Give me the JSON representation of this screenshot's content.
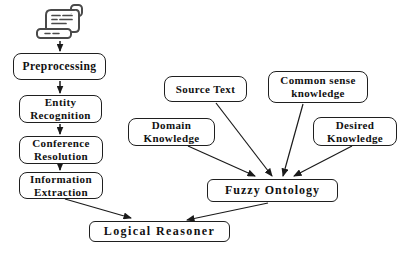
{
  "diagram": {
    "nodes": {
      "preprocessing": {
        "label": "Preprocessing"
      },
      "entity_recognition": {
        "label": "Entity Recognition"
      },
      "conference_resolution": {
        "label": "Conference Resolution"
      },
      "information_extraction": {
        "label": "Information Extraction"
      },
      "logical_reasoner": {
        "label": "Logical Reasoner"
      },
      "source_text": {
        "label": "Source Text"
      },
      "common_sense_knowledge": {
        "label": "Common sense knowledge"
      },
      "domain_knowledge": {
        "label": "Domain Knowledge"
      },
      "desired_knowledge": {
        "label": "Desired Knowledge"
      },
      "fuzzy_ontology": {
        "label": "Fuzzy Ontology"
      }
    },
    "icons": [
      {
        "name": "scroll-document-icon",
        "meaning": "input text document"
      }
    ],
    "edges": [
      {
        "from": "scroll-document-icon",
        "to": "preprocessing"
      },
      {
        "from": "preprocessing",
        "to": "entity_recognition"
      },
      {
        "from": "entity_recognition",
        "to": "conference_resolution"
      },
      {
        "from": "conference_resolution",
        "to": "information_extraction"
      },
      {
        "from": "information_extraction",
        "to": "logical_reasoner"
      },
      {
        "from": "fuzzy_ontology",
        "to": "logical_reasoner"
      },
      {
        "from": "domain_knowledge",
        "to": "fuzzy_ontology"
      },
      {
        "from": "source_text",
        "to": "fuzzy_ontology"
      },
      {
        "from": "common_sense_knowledge",
        "to": "fuzzy_ontology"
      },
      {
        "from": "desired_knowledge",
        "to": "fuzzy_ontology"
      }
    ],
    "colors": {
      "background": "#ffffff",
      "box_border": "#1f1f1f",
      "line": "#1a1a1a",
      "text": "#111111",
      "icon_stroke": "#4a4a4a"
    }
  }
}
